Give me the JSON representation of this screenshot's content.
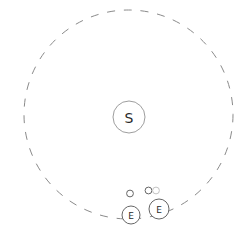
{
  "diagram": {
    "canvas": {
      "width": 251,
      "height": 241,
      "background": "#ffffff"
    },
    "colors": {
      "orbit_stroke": "#8a8a8a",
      "sun_stroke": "#9e9e9e",
      "body_stroke": "#666666",
      "faint_stroke": "#c3c3c3",
      "label_color": "#2a2a2a"
    },
    "orbit": {
      "cx": 128.5,
      "cy": 114.5,
      "r": 104.5,
      "dash": "8 8.8",
      "stroke_width": 1
    },
    "sun": {
      "label": "S",
      "cx": 129,
      "cy": 117,
      "r": 16,
      "font_size": 14
    },
    "moons": [
      {
        "cx": 130,
        "cy": 193.5,
        "r": 3.4,
        "style": "solid"
      },
      {
        "cx": 148.5,
        "cy": 190.5,
        "r": 3.4,
        "style": "solid"
      },
      {
        "cx": 156,
        "cy": 190.5,
        "r": 3.4,
        "style": "faint"
      }
    ],
    "earths": [
      {
        "label": "E",
        "cx": 131,
        "cy": 215,
        "r": 9,
        "font_size": 9
      },
      {
        "label": "E",
        "cx": 159,
        "cy": 209,
        "r": 10,
        "font_size": 9
      }
    ]
  }
}
